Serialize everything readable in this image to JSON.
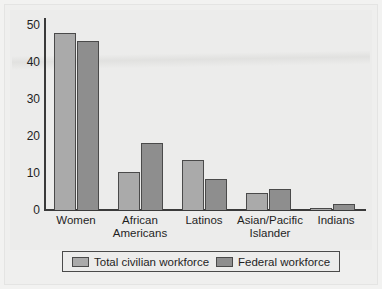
{
  "chart_data": {
    "type": "bar",
    "title": "",
    "subtitle": "",
    "xlabel": "",
    "ylabel": "",
    "ylim": [
      0,
      50
    ],
    "yticks": [
      0,
      10,
      20,
      30,
      40,
      50
    ],
    "grid": false,
    "legend_position": "bottom",
    "categories": [
      "Women",
      "African Americans",
      "Latinos",
      "Asian/Pacific Islander",
      "Indians"
    ],
    "category_lines": [
      [
        "Women"
      ],
      [
        "African",
        "Americans"
      ],
      [
        "Latinos"
      ],
      [
        "Asian/Pacific",
        "Islander"
      ],
      [
        "Indians"
      ]
    ],
    "series": [
      {
        "name": "Total civilian workforce",
        "color": "#aaaaaa",
        "values": [
          46,
          10,
          13,
          4.5,
          0.5
        ]
      },
      {
        "name": "Federal workforce",
        "color": "#8e8e8e",
        "values": [
          44,
          17.5,
          8,
          5.5,
          1.5
        ]
      }
    ]
  },
  "axis": {
    "tick_labels": [
      "50",
      "40",
      "30",
      "20",
      "10",
      "0"
    ]
  },
  "legend": {
    "entries": [
      {
        "label": "Total civilian workforce",
        "swatch": "legend-swatch-civilian"
      },
      {
        "label": "Federal workforce",
        "swatch": "legend-swatch-federal"
      }
    ]
  }
}
